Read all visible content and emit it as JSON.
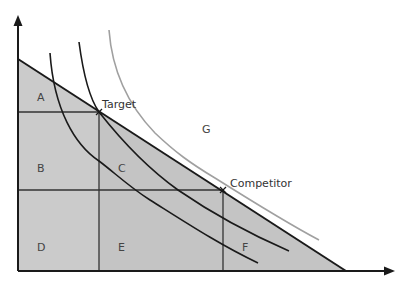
{
  "diagram": {
    "type": "indifference-curve-budget-diagram",
    "colors": {
      "background": "#ffffff",
      "shade_left": "#cbcbcb",
      "shade_right": "#c4c4c4",
      "axis": "#1a1a1a",
      "budget_line": "#1a1a1a",
      "curve_dark": "#1a1a1a",
      "curve_light": "#a0a0a0",
      "grid": "#333333"
    },
    "axes": {
      "origin": [
        18,
        271
      ],
      "y_axis_top": [
        18,
        16
      ],
      "x_axis_right": [
        393,
        271
      ],
      "x_label": "",
      "y_label": ""
    },
    "budget_line": {
      "start": [
        18,
        59
      ],
      "end": [
        346,
        271
      ]
    },
    "points": [
      {
        "name": "Target",
        "x": 99,
        "y": 112,
        "label_x": 102,
        "label_y": 108
      },
      {
        "name": "Competitor",
        "x": 223,
        "y": 190,
        "label_x": 230,
        "label_y": 187
      }
    ],
    "region_labels": [
      {
        "label": "A",
        "x": 37,
        "y": 101
      },
      {
        "label": "B",
        "x": 37,
        "y": 172
      },
      {
        "label": "C",
        "x": 118,
        "y": 172
      },
      {
        "label": "D",
        "x": 37,
        "y": 251
      },
      {
        "label": "E",
        "x": 118,
        "y": 251
      },
      {
        "label": "F",
        "x": 242,
        "y": 251
      },
      {
        "label": "G",
        "x": 202,
        "y": 133
      }
    ],
    "curves": [
      {
        "name": "indifference-curve-inner",
        "path": "M50,53 C54,110 75,145 99,161 C115,173 128,186 150,200 C185,222 220,245 258,263",
        "color": "curve_dark"
      },
      {
        "name": "indifference-curve-middle",
        "path": "M79,42 C84,80 92,102 99,112 C125,145 150,170 178,190 C210,212 250,234 289,251",
        "color": "curve_dark"
      },
      {
        "name": "indifference-curve-outer",
        "path": "M109,30 C112,70 128,105 155,133 C175,152 190,163 215,178 C250,200 285,222 319,240",
        "color": "curve_light"
      }
    ]
  }
}
